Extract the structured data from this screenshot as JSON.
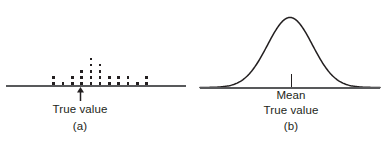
{
  "figure": {
    "background_color": "#ffffff",
    "ink_color": "#231f20",
    "axis_color": "#58595b",
    "width": 386,
    "height": 143
  },
  "panel_a": {
    "caption": "(a)",
    "axis_label": "True value",
    "marker_icon": "up-arrow-icon",
    "baseline_icon": "horizontal-axis-line"
  },
  "panel_b": {
    "caption": "(b)",
    "center_label": "Mean",
    "axis_label": "True value",
    "marker_icon": "tick-mark-icon",
    "curve_icon": "bell-curve-icon",
    "baseline_icon": "horizontal-axis-line"
  },
  "chart_data": [
    {
      "type": "bar",
      "subtype": "dotplot",
      "title": "(a)",
      "xlabel": "True value",
      "ylabel": "",
      "grid": false,
      "legend": "none",
      "annotations": [
        "True value"
      ],
      "categories": [
        "1",
        "2",
        "3",
        "4",
        "5",
        "6",
        "7",
        "8",
        "9",
        "10",
        "11"
      ],
      "values": [
        2,
        1,
        2,
        3,
        5,
        4,
        2,
        2,
        2,
        1,
        2
      ],
      "true_value_category": "5",
      "xlim": [
        0,
        12
      ],
      "ylim": [
        0,
        6
      ]
    },
    {
      "type": "line",
      "subtype": "normal-distribution-curve",
      "title": "(b)",
      "xlabel": "True value",
      "ylabel": "",
      "grid": false,
      "legend": "none",
      "annotations": [
        "Mean",
        "True value"
      ],
      "mean": 0,
      "sd": 1,
      "x": [
        -4,
        -3.5,
        -3,
        -2.5,
        -2,
        -1.5,
        -1,
        -0.5,
        0,
        0.5,
        1,
        1.5,
        2,
        2.5,
        3,
        3.5,
        4
      ],
      "values": [
        0.0,
        0.01,
        0.04,
        0.13,
        0.32,
        0.61,
        0.88,
        0.99,
        1.0,
        0.99,
        0.88,
        0.61,
        0.32,
        0.13,
        0.04,
        0.01,
        0.0
      ],
      "xlim": [
        -4,
        4
      ],
      "ylim": [
        0,
        1.05
      ]
    }
  ]
}
